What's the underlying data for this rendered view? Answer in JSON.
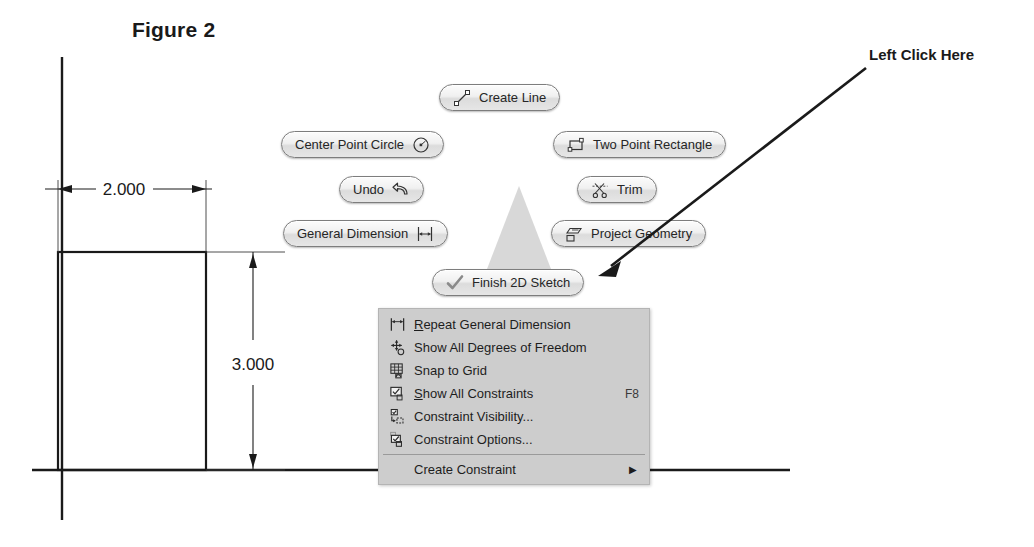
{
  "figure": {
    "title": "Figure 2"
  },
  "annotation": {
    "label": "Left Click Here"
  },
  "drawing": {
    "width_dimension": "2.000",
    "height_dimension": "3.000"
  },
  "marking_menu": {
    "items": [
      {
        "id": "create-line",
        "label": "Create Line",
        "icon": "line-icon",
        "icon_side": "left"
      },
      {
        "id": "center-circle",
        "label": "Center Point Circle",
        "icon": "circle-icon",
        "icon_side": "right"
      },
      {
        "id": "two-point-rect",
        "label": "Two Point Rectangle",
        "icon": "rectangle-icon",
        "icon_side": "left"
      },
      {
        "id": "undo",
        "label": "Undo",
        "icon": "undo-arrow-icon",
        "icon_side": "right"
      },
      {
        "id": "trim",
        "label": "Trim",
        "icon": "scissors-icon",
        "icon_side": "left"
      },
      {
        "id": "general-dim",
        "label": "General Dimension",
        "icon": "dimension-icon",
        "icon_side": "right"
      },
      {
        "id": "project-geometry",
        "label": "Project Geometry",
        "icon": "project-geometry-icon",
        "icon_side": "left"
      },
      {
        "id": "finish-sketch",
        "label": "Finish 2D Sketch",
        "icon": "checkmark-icon",
        "icon_side": "left"
      }
    ]
  },
  "context_menu": {
    "items": [
      {
        "id": "repeat-general-dimension",
        "label": "Repeat General Dimension",
        "accel": "R",
        "icon": "dimension-icon",
        "shortcut": ""
      },
      {
        "id": "show-all-degrees-of-freedom",
        "label": "Show All Degrees of Freedom",
        "accel": "",
        "icon": "degrees-of-freedom-icon",
        "shortcut": ""
      },
      {
        "id": "snap-to-grid",
        "label": "Snap to Grid",
        "accel": "",
        "icon": "grid-icon",
        "shortcut": ""
      },
      {
        "id": "show-all-constraints",
        "label": "Show All Constraints",
        "accel": "S",
        "icon": "constraint-show-icon",
        "shortcut": "F8"
      },
      {
        "id": "constraint-visibility",
        "label": "Constraint Visibility...",
        "accel": "",
        "icon": "constraint-visibility-icon",
        "shortcut": ""
      },
      {
        "id": "constraint-options",
        "label": "Constraint Options...",
        "accel": "",
        "icon": "constraint-options-icon",
        "shortcut": ""
      },
      {
        "id": "create-constraint",
        "label": "Create Constraint",
        "accel": "",
        "icon": "",
        "shortcut": "",
        "submenu": true
      }
    ]
  },
  "colors": {
    "menu_background": "#cdcdcd",
    "pill_border": "#7d7d7d",
    "line_color": "#1a1a1a",
    "triangle_fill": "#d6d6d6"
  }
}
